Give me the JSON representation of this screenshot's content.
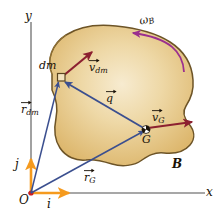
{
  "figure": {
    "background": "#ffffff",
    "width": 221,
    "height": 220
  },
  "colors": {
    "body_fill": "#e3c27f",
    "body_fill_light": "#f3e3c0",
    "body_outline": "#6d5427",
    "axis": "#8a8a8a",
    "unit_vector": "#f59a1e",
    "position_vector": "#3b4f8f",
    "velocity_vector": "#8c2030",
    "omega_arc": "#9b2f8f",
    "origin_dot": "#d01e1e",
    "label_text": "#1a1208"
  },
  "axes": {
    "y_label": "y",
    "x_label": "x",
    "origin_label": "O"
  },
  "unit_vectors": [
    {
      "name": "i-hat",
      "label": "i"
    },
    {
      "name": "j-hat",
      "label": "j"
    }
  ],
  "body": {
    "label": "B",
    "name": "rigid-body-B"
  },
  "points": [
    {
      "name": "dm-element",
      "label": "dm"
    },
    {
      "name": "center-of-mass",
      "label": "G"
    }
  ],
  "vectors": [
    {
      "name": "r-dm",
      "symbol": "r",
      "subscript": "dm",
      "kind": "position"
    },
    {
      "name": "r-G",
      "symbol": "r",
      "subscript": "G",
      "kind": "position"
    },
    {
      "name": "q",
      "symbol": "q",
      "subscript": "",
      "kind": "relative-position"
    },
    {
      "name": "v-dm",
      "symbol": "v",
      "subscript": "dm",
      "kind": "velocity"
    },
    {
      "name": "v-G",
      "symbol": "v",
      "subscript": "G",
      "kind": "velocity"
    }
  ],
  "angular_velocity": {
    "name": "omega-B",
    "symbol": "ω",
    "subscript": "B"
  },
  "labels": {
    "y_axis": "y",
    "x_axis": "x",
    "origin": "O",
    "i_hat": "i",
    "j_hat": "j",
    "dm": "dm",
    "G": "G",
    "B": "B",
    "r_sym": "r",
    "r_dm_sub": "dm",
    "r_G_sub": "G",
    "q_sym": "q",
    "v_sym": "v",
    "v_dm_sub": "dm",
    "v_G_sub": "G",
    "omega_sym": "ω",
    "omega_sub": "B"
  }
}
